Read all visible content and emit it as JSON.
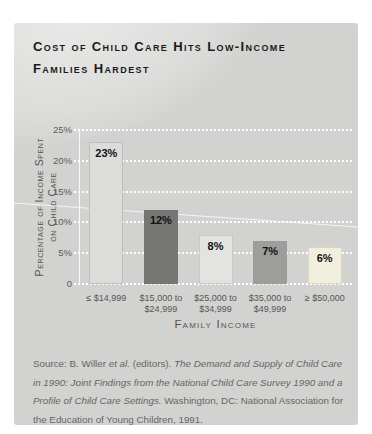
{
  "title": {
    "line1": "Cost of Child Care Hits Low-Income",
    "line2": "Families Hardest"
  },
  "chart_data": {
    "type": "bar",
    "title": "Cost of Child Care Hits Low-Income Families Hardest",
    "categories": [
      "≤ $14,999",
      "$15,000 to $24,999",
      "$25,000 to $34,999",
      "$35,000 to $49,999",
      "≥ $50,000"
    ],
    "category_lines": [
      [
        "≤ $14,999"
      ],
      [
        "$15,000 to",
        "$24,999"
      ],
      [
        "$25,000 to",
        "$34,999"
      ],
      [
        "$35,000 to",
        "$49,999"
      ],
      [
        "≥ $50,000"
      ]
    ],
    "values": [
      23,
      12,
      8,
      7,
      6
    ],
    "value_labels": [
      "23%",
      "12%",
      "8%",
      "7%",
      "6%"
    ],
    "xlabel": "Family Income",
    "ylabel": "Percentage of Income Spent on Child Care",
    "ylabel_lines": [
      "Percentage of Income Spent",
      "on Child Care"
    ],
    "ylim": [
      0,
      25
    ],
    "yticks": [
      0,
      5,
      10,
      15,
      20,
      25
    ],
    "ytick_labels": [
      "0",
      "5%",
      "10%",
      "15%",
      "20%",
      "25%"
    ],
    "grid": "horizontal-dotted-white",
    "legend": "none",
    "bar_colors": [
      "#dcdcda",
      "#767674",
      "#e3e3e1",
      "#9d9d9b",
      "#f2efdf"
    ],
    "bar_borders": [
      "#bfbfbd",
      "none",
      "#c8c8c6",
      "none",
      "#dad7c5"
    ]
  },
  "source": {
    "pre": "Source: B. Willer ",
    "etal": "et al.",
    "mid": " (editors). ",
    "book": "The Demand and Supply of Child Care in 1990: Joint Findings from the National Child Care Survey 1990 and a Profile of Child Care Settings.",
    "post": " Washington, DC: National Association for the Education of Young Children, 1991."
  },
  "colors": {
    "page_bg": "#ffffff",
    "panel_bg": "#d2d2d0",
    "title_text": "#1a1a1a",
    "axis_text": "#5d5d5b",
    "source_text": "#666664",
    "gridline": "#ffffff",
    "value_label_text": "#111111"
  }
}
